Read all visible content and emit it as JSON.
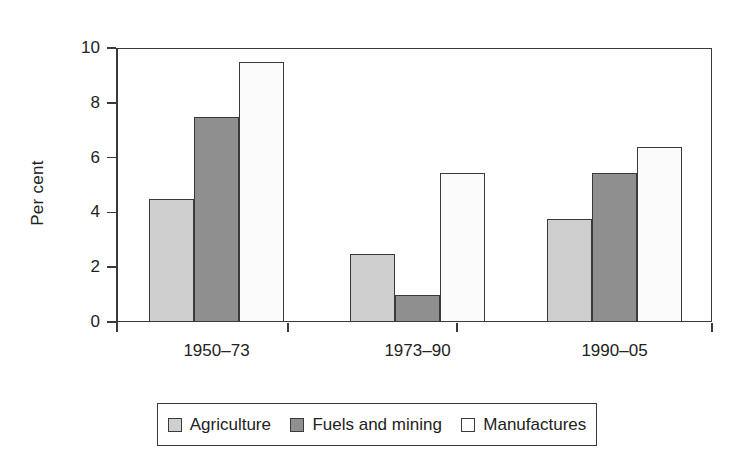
{
  "chart_data": {
    "type": "bar",
    "title": "",
    "subtitle": "",
    "xlabel": "",
    "ylabel": "Per cent",
    "categories": [
      "1950–73",
      "1973–90",
      "1990–05"
    ],
    "series": [
      {
        "name": "Agriculture",
        "values": [
          4.5,
          2.5,
          3.75
        ],
        "color": "#cfcfcf"
      },
      {
        "name": "Fuels and mining",
        "values": [
          7.5,
          1.0,
          5.45
        ],
        "color": "#8f8f8f"
      },
      {
        "name": "Manufactures",
        "values": [
          9.5,
          5.45,
          6.4
        ],
        "color": "#ffffff"
      }
    ],
    "ylim": [
      0,
      10
    ],
    "yticks": [
      0,
      2,
      4,
      6,
      8,
      10
    ],
    "ytick_labels": [
      "0",
      "2",
      "4",
      "6",
      "8",
      "10"
    ],
    "grid": false,
    "legend_position": "bottom",
    "axis_color": "#3a3a3a",
    "background": "#ffffff"
  },
  "legend": {
    "items": [
      {
        "label": "Agriculture"
      },
      {
        "label": "Fuels and mining"
      },
      {
        "label": "Manufactures"
      }
    ]
  }
}
